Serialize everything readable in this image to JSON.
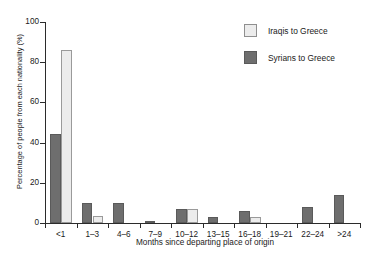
{
  "chart_data": {
    "type": "bar",
    "title": "",
    "xlabel": "Months since departing place of origin",
    "ylabel": "Percentage of people from each nationality (%)",
    "categories": [
      "<1",
      "1–3",
      "4–6",
      "7–9",
      "10–12",
      "13–15",
      "16–18",
      "19–21",
      "22–24",
      ">24"
    ],
    "series": [
      {
        "name": "Iraqis to Greece",
        "color": "#ececec",
        "values": [
          86,
          3.5,
          0,
          0,
          7,
          0,
          3,
          0,
          0,
          0
        ]
      },
      {
        "name": "Syrians to Greece",
        "color": "#6e6e6e",
        "values": [
          44.5,
          10,
          10,
          1,
          7,
          3,
          6,
          0,
          8,
          14
        ]
      }
    ],
    "ylim": [
      0,
      100
    ],
    "yticks": [
      0,
      20,
      40,
      60,
      80,
      100
    ],
    "ytick_labels": [
      "0",
      "20",
      "40",
      "60",
      "80",
      "100"
    ],
    "grid": false,
    "legend_position": "top-right"
  },
  "legend": {
    "items": [
      {
        "label": "Iraqis to Greece",
        "swatch": "light"
      },
      {
        "label": "Syrians to Greece",
        "swatch": "dark"
      }
    ]
  }
}
